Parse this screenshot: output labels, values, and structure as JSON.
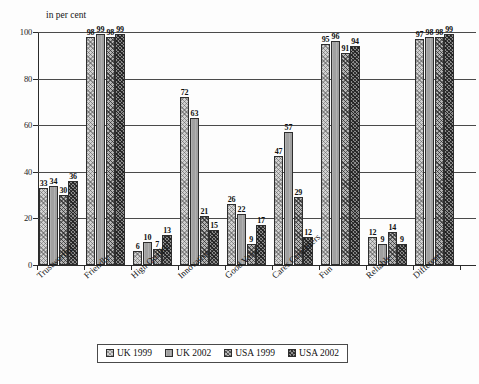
{
  "chart_data": {
    "type": "bar",
    "title": "",
    "subtitle": "",
    "axis_note": "in per cent",
    "xlabel": "",
    "ylabel": "in per cent",
    "ylim": [
      0,
      100
    ],
    "yticks": [
      0,
      20,
      40,
      60,
      80,
      100
    ],
    "grid": true,
    "legend_position": "bottom",
    "value_labels": true,
    "categories": [
      "Trustworthy",
      "Friendly",
      "High Quality",
      "Innovative",
      "Good Value",
      "Cares Customers",
      "Fun",
      "Reliable",
      "Different"
    ],
    "series": [
      {
        "name": "UK 1999",
        "color": "#d2d2d2",
        "pattern": "dotted",
        "values": [
          33,
          98,
          6,
          72,
          26,
          47,
          95,
          12,
          97
        ]
      },
      {
        "name": "UK 2002",
        "color": "#a0a0a0",
        "pattern": "solid-gray",
        "values": [
          34,
          99,
          10,
          63,
          22,
          57,
          96,
          9,
          98
        ]
      },
      {
        "name": "USA 1999",
        "color": "#b4b4b4",
        "pattern": "crosshatch",
        "values": [
          30,
          98,
          7,
          21,
          9,
          29,
          91,
          14,
          98
        ]
      },
      {
        "name": "USA 2002",
        "color": "#8a8a8a",
        "pattern": "dense-hatch",
        "values": [
          36,
          99,
          13,
          15,
          17,
          12,
          94,
          9,
          99
        ]
      }
    ]
  }
}
